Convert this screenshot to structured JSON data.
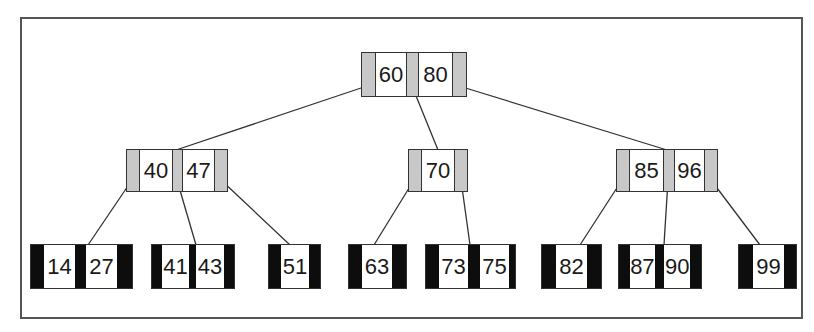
{
  "diagram": {
    "type": "b-tree",
    "colors": {
      "internal_pointer": "#c8c8c8",
      "leaf_pointer": "#0d0d0d",
      "key_background": "#ffffff",
      "edge": "#333333",
      "frame": "#555555"
    },
    "root": {
      "keys": [
        "60",
        "80"
      ]
    },
    "level1": [
      {
        "keys": [
          "40",
          "47"
        ]
      },
      {
        "keys": [
          "70"
        ]
      },
      {
        "keys": [
          "85",
          "96"
        ]
      }
    ],
    "leaves": [
      {
        "keys": [
          "14",
          "27"
        ]
      },
      {
        "keys": [
          "41",
          "43"
        ]
      },
      {
        "keys": [
          "51"
        ]
      },
      {
        "keys": [
          "63"
        ]
      },
      {
        "keys": [
          "73",
          "75"
        ]
      },
      {
        "keys": [
          "82"
        ]
      },
      {
        "keys": [
          "87",
          "90"
        ]
      },
      {
        "keys": [
          "99"
        ]
      }
    ],
    "edges": [
      {
        "from": "root.ptr0",
        "to": "level1.0"
      },
      {
        "from": "root.ptr1",
        "to": "level1.1"
      },
      {
        "from": "root.ptr2",
        "to": "level1.2"
      },
      {
        "from": "level1.0.ptr0",
        "to": "leaves.0"
      },
      {
        "from": "level1.0.ptr1",
        "to": "leaves.1"
      },
      {
        "from": "level1.0.ptr2",
        "to": "leaves.2"
      },
      {
        "from": "level1.1.ptr0",
        "to": "leaves.3"
      },
      {
        "from": "level1.1.ptr1",
        "to": "leaves.4"
      },
      {
        "from": "level1.2.ptr0",
        "to": "leaves.5"
      },
      {
        "from": "level1.2.ptr1",
        "to": "leaves.6"
      },
      {
        "from": "level1.2.ptr2",
        "to": "leaves.7"
      }
    ]
  }
}
